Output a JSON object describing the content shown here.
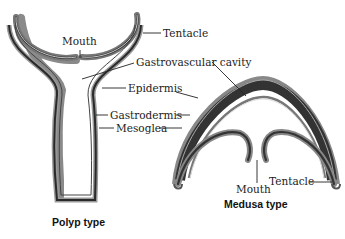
{
  "diagram": {
    "polyp": {
      "caption": "Polyp type",
      "labels": {
        "mouth": "Mouth",
        "tentacle": "Tentacle",
        "gastrovascular_cavity": "Gastrovascular cavity",
        "epidermis": "Epidermis",
        "gastrodermis": "Gastrodermis",
        "mesoglea": "Mesoglea"
      }
    },
    "medusa": {
      "caption": "Medusa type",
      "labels": {
        "mouth": "Mouth",
        "tentacle": "Tentacle"
      }
    },
    "colors": {
      "epidermis": "#9a9a9a",
      "mesoglea": "#3a3a3a",
      "gastrodermis": "#d8d8d8",
      "outline": "#222222"
    }
  }
}
